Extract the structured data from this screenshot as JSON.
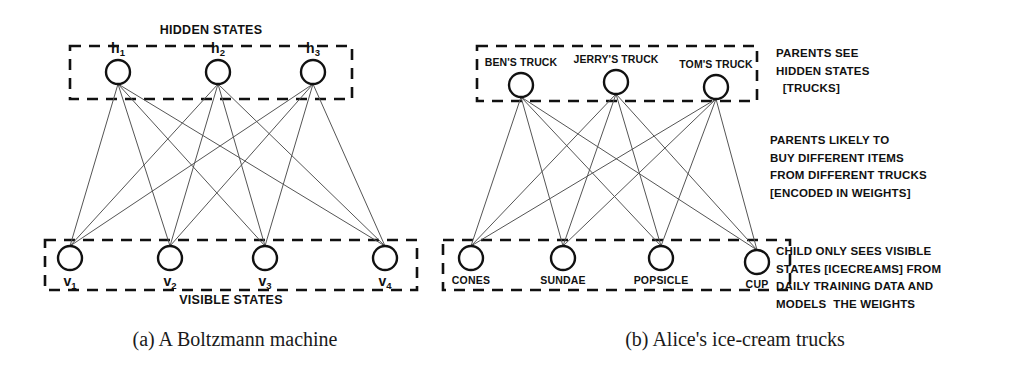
{
  "figure": {
    "panel_a": {
      "caption": "(a) A Boltzmann machine",
      "hidden_group_title": "HIDDEN STATES",
      "visible_group_title": "VISIBLE STATES",
      "hidden_nodes": [
        {
          "id": "h1",
          "base": "h",
          "sub": "1",
          "cx": 118,
          "cy": 72
        },
        {
          "id": "h2",
          "base": "h",
          "sub": "2",
          "cx": 218,
          "cy": 72
        },
        {
          "id": "h3",
          "base": "h",
          "sub": "3",
          "cx": 313,
          "cy": 72
        }
      ],
      "visible_nodes": [
        {
          "id": "v1",
          "base": "v",
          "sub": "1",
          "cx": 70,
          "cy": 258
        },
        {
          "id": "v2",
          "base": "v",
          "sub": "2",
          "cx": 170,
          "cy": 258
        },
        {
          "id": "v3",
          "base": "v",
          "sub": "3",
          "cx": 265,
          "cy": 258
        },
        {
          "id": "v4",
          "base": "v",
          "sub": "4",
          "cx": 385,
          "cy": 258
        }
      ],
      "hidden_box": {
        "x": 70,
        "y": 46,
        "w": 282,
        "h": 53
      },
      "visible_box": {
        "x": 45,
        "y": 240,
        "w": 372,
        "h": 50
      }
    },
    "panel_b": {
      "caption": "(b) Alice's ice-cream trucks",
      "hidden_nodes": [
        {
          "id": "ben",
          "label": "BEN'S TRUCK",
          "cx": 521,
          "cy": 85
        },
        {
          "id": "jerry",
          "label": "JERRY'S TRUCK",
          "cx": 616,
          "cy": 82
        },
        {
          "id": "tom",
          "label": "TOM'S TRUCK",
          "cx": 716,
          "cy": 87
        }
      ],
      "visible_nodes": [
        {
          "id": "cones",
          "label": "CONES",
          "cx": 471,
          "cy": 258
        },
        {
          "id": "sundae",
          "label": "SUNDAE",
          "cx": 563,
          "cy": 258
        },
        {
          "id": "popsicle",
          "label": "POPSICLE",
          "cx": 661,
          "cy": 258
        },
        {
          "id": "cup",
          "label": "CUP",
          "cx": 757,
          "cy": 262
        }
      ],
      "hidden_box": {
        "x": 477,
        "y": 46,
        "w": 280,
        "h": 55
      },
      "visible_box": {
        "x": 443,
        "y": 240,
        "w": 347,
        "h": 50
      },
      "annotations": [
        {
          "id": "parents-see-hidden",
          "x": 776,
          "y": 45,
          "lines": [
            "PARENTS SEE",
            "HIDDEN STATES",
            "  [TRUCKS]"
          ]
        },
        {
          "id": "parents-buy-weights",
          "x": 770,
          "y": 132,
          "lines": [
            "PARENTS LIKELY TO",
            "BUY DIFFERENT ITEMS",
            "FROM DIFFERENT TRUCKS",
            "[ENCODED IN WEIGHTS]"
          ]
        },
        {
          "id": "child-sees-visible",
          "x": 776,
          "y": 243,
          "lines": [
            "CHILD ONLY SEES VISIBLE",
            "STATES [ICECREAMS] FROM",
            "DAILY TRAINING DATA AND",
            "MODELS  THE WEIGHTS"
          ]
        }
      ]
    },
    "style": {
      "node_radius": 12,
      "node_stroke": "#111111",
      "node_fill": "#ffffff",
      "edge_stroke": "#555555",
      "box_stroke": "#111111",
      "background": "#ffffff"
    }
  }
}
